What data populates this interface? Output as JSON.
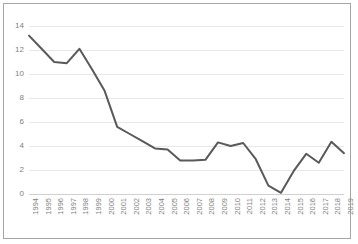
{
  "chart_data": {
    "type": "line",
    "title": "",
    "subtitle": "",
    "xlabel": "",
    "ylabel": "",
    "categories": [
      "1994",
      "1995",
      "1996",
      "1997",
      "1998",
      "1999",
      "2000",
      "2001",
      "2002",
      "2003",
      "2004",
      "2005",
      "2006",
      "2007",
      "2008",
      "2009",
      "2010",
      "2011",
      "2012",
      "2013",
      "2014",
      "2015",
      "2016",
      "2017",
      "2018",
      "2019"
    ],
    "values": [
      13.2,
      12.1,
      11.0,
      10.9,
      12.1,
      10.4,
      8.6,
      5.6,
      5.0,
      4.4,
      3.8,
      3.7,
      2.8,
      2.8,
      2.85,
      4.3,
      4.0,
      4.25,
      2.9,
      0.7,
      0.1,
      1.9,
      3.35,
      2.6,
      4.35,
      3.4
    ],
    "series": [
      {
        "name": "series-1",
        "values": [
          13.2,
          12.1,
          11.0,
          10.9,
          12.1,
          10.4,
          8.6,
          5.6,
          5.0,
          4.4,
          3.8,
          3.7,
          2.8,
          2.8,
          2.85,
          4.3,
          4.0,
          4.25,
          2.9,
          0.7,
          0.1,
          1.9,
          3.35,
          2.6,
          4.35,
          3.4
        ],
        "color": "#595959"
      }
    ],
    "yticks": [
      0,
      2,
      4,
      6,
      8,
      10,
      12,
      14
    ],
    "ylim": [
      0,
      14
    ],
    "xlim_labels": [
      "1994",
      "2019"
    ],
    "grid": true,
    "legend": false,
    "legend_position": "none",
    "annotations": []
  },
  "style": {
    "line_color": "#595959",
    "grid_color": "#e8e8e8",
    "axis_label_color": "#808080",
    "frame_border_color": "#a6a6a6",
    "background": "#ffffff",
    "line_width": 2
  }
}
